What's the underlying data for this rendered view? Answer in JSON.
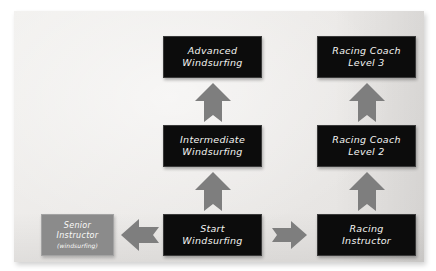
{
  "diagram": {
    "background_color": "#eceae8",
    "node_color": "#0c0c0c",
    "alt_node_color": "#8b8b8b",
    "arrow_color": "#7e7e7e",
    "text_color": "#f4f4f2"
  },
  "nodes": {
    "advanced_windsurfing": {
      "line1": "Advanced",
      "line2": "Windsurfing",
      "style": "dark"
    },
    "racing_coach_level_3": {
      "line1": "Racing Coach",
      "line2": "Level 3",
      "style": "dark"
    },
    "intermediate_windsurfing": {
      "line1": "Intermediate",
      "line2": "Windsurfing",
      "style": "dark"
    },
    "racing_coach_level_2": {
      "line1": "Racing Coach",
      "line2": "Level 2",
      "style": "dark"
    },
    "start_windsurfing": {
      "line1": "Start",
      "line2": "Windsurfing",
      "style": "dark"
    },
    "racing_instructor": {
      "line1": "Racing",
      "line2": "Instructor",
      "style": "dark"
    },
    "senior_instructor": {
      "line1": "Senior",
      "line2": "Instructor",
      "line3": "(windsurfing)",
      "style": "grey"
    }
  },
  "arrows": {
    "start_to_intermediate": {
      "direction": "up",
      "label": "progresses to"
    },
    "intermediate_to_advanced": {
      "direction": "up",
      "label": "progresses to"
    },
    "racing_instructor_to_coach2": {
      "direction": "up",
      "label": "progresses to"
    },
    "coach2_to_coach3": {
      "direction": "up",
      "label": "progresses to"
    },
    "start_to_senior_instructor": {
      "direction": "left",
      "label": "leads to"
    },
    "start_to_racing_instructor": {
      "direction": "right",
      "label": "leads to"
    }
  }
}
